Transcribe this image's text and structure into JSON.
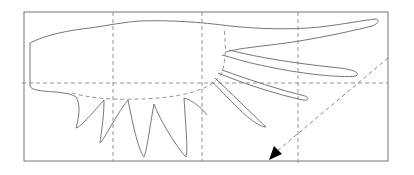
{
  "diagram": {
    "colors": {
      "background": "#ffffff",
      "outline": "#777777",
      "guide": "#888888",
      "arrow": "#000000"
    },
    "frame": {
      "x": 24,
      "y": 12,
      "width": 364,
      "height": 149
    },
    "guides": {
      "vertical_x": [
        113,
        202,
        298
      ],
      "horizontal_y": [
        83
      ]
    },
    "arrow": {
      "from": [
        388,
        58
      ],
      "to": [
        270,
        160
      ],
      "style": "dashed"
    }
  }
}
